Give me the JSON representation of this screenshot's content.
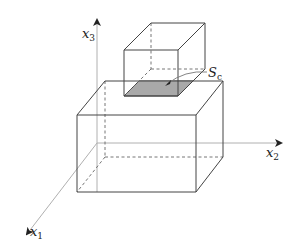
{
  "diagram": {
    "axes": {
      "x1": {
        "label": "x",
        "subscript": "1"
      },
      "x2": {
        "label": "x",
        "subscript": "2"
      },
      "x3": {
        "label": "x",
        "subscript": "3"
      }
    },
    "contact_surface": {
      "label": "S",
      "subscript": "c",
      "fill": "#a9a9a9"
    },
    "colors": {
      "axis": "#aaaaaa",
      "edge": "#444444",
      "hidden_edge": "#555555"
    }
  }
}
